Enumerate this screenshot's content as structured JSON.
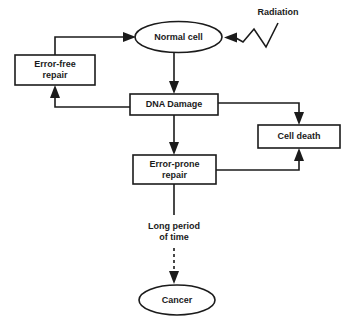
{
  "diagram": {
    "background_color": "#ffffff",
    "line_color": "#1b1b1b",
    "text_color": "#1b1b1b",
    "nodes": [
      {
        "id": "normal_cell",
        "label": "Normal cell",
        "shape": "ellipse"
      },
      {
        "id": "error_free_repair",
        "label_line1": "Error-free",
        "label_line2": "repair",
        "shape": "rect"
      },
      {
        "id": "dna_damage",
        "label": "DNA Damage",
        "shape": "rect"
      },
      {
        "id": "cell_death",
        "label": "Cell death",
        "shape": "rect"
      },
      {
        "id": "error_prone_repair",
        "label_line1": "Error-prone",
        "label_line2": "repair",
        "shape": "rect"
      },
      {
        "id": "cancer",
        "label": "Cancer",
        "shape": "ellipse"
      }
    ],
    "annotations": [
      {
        "id": "radiation",
        "label": "Radiation"
      },
      {
        "id": "long_period",
        "label_line1": "Long period",
        "label_line2": "of time"
      }
    ],
    "edges": [
      {
        "from": "radiation",
        "to": "normal_cell",
        "style": "zigzag"
      },
      {
        "from": "normal_cell",
        "to": "dna_damage",
        "style": "solid"
      },
      {
        "from": "dna_damage",
        "to": "error_free_repair",
        "style": "solid"
      },
      {
        "from": "error_free_repair",
        "to": "normal_cell",
        "style": "solid"
      },
      {
        "from": "dna_damage",
        "to": "cell_death",
        "style": "solid"
      },
      {
        "from": "dna_damage",
        "to": "error_prone_repair",
        "style": "solid"
      },
      {
        "from": "error_prone_repair",
        "to": "cell_death",
        "style": "solid"
      },
      {
        "from": "error_prone_repair",
        "to": "cancer",
        "style": "dashed",
        "label": "Long period of time"
      }
    ]
  }
}
